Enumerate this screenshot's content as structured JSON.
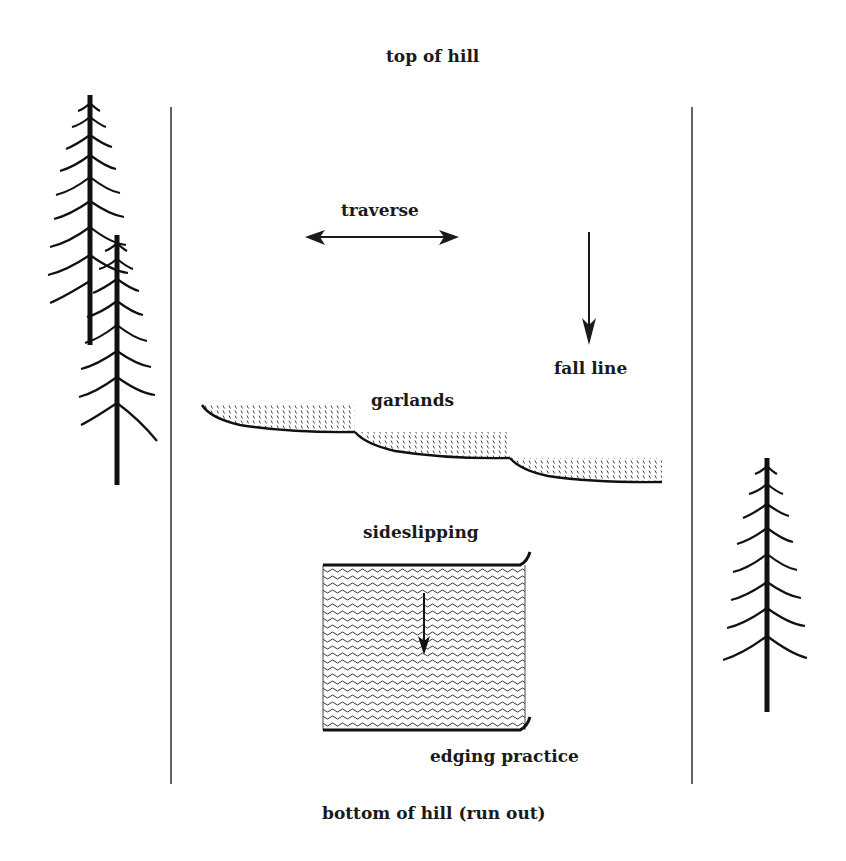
{
  "diagram": {
    "title_top": "top of hill",
    "title_bottom": "bottom of hill (run out)",
    "labels": {
      "traverse": "traverse",
      "fall_line": "fall line",
      "garlands": "garlands",
      "sideslipping": "sideslipping",
      "edging_practice": "edging practice"
    },
    "colors": {
      "ink": "#1a1a1a",
      "background": "#ffffff"
    }
  }
}
